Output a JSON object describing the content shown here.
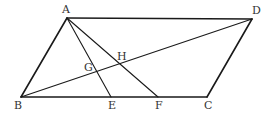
{
  "diagram": {
    "type": "geometry",
    "stroke_color": "#1a1a1a",
    "label_color": "#333333",
    "points": {
      "A": {
        "label": "A",
        "x": 67,
        "y": 18,
        "label_x": 62,
        "label_y": 13
      },
      "B": {
        "label": "B",
        "x": 21,
        "y": 97,
        "label_x": 14,
        "label_y": 109
      },
      "C": {
        "label": "C",
        "x": 207,
        "y": 97,
        "label_x": 204,
        "label_y": 109
      },
      "D": {
        "label": "D",
        "x": 252,
        "y": 19,
        "label_x": 252,
        "label_y": 14
      },
      "E": {
        "label": "E",
        "x": 111,
        "y": 97,
        "label_x": 108,
        "label_y": 109
      },
      "F": {
        "label": "F",
        "x": 158,
        "y": 97,
        "label_x": 155,
        "label_y": 109
      },
      "G": {
        "label": "G",
        "x": 97,
        "y": 71,
        "label_x": 84,
        "label_y": 71
      },
      "H": {
        "label": "H",
        "x": 120,
        "y": 64,
        "label_x": 117,
        "label_y": 60
      }
    },
    "segments": [
      {
        "from": "A",
        "to": "D",
        "name": "side-ad"
      },
      {
        "from": "D",
        "to": "C",
        "name": "side-dc"
      },
      {
        "from": "C",
        "to": "B",
        "name": "side-cb"
      },
      {
        "from": "B",
        "to": "A",
        "name": "side-ba"
      },
      {
        "from": "A",
        "to": "E",
        "name": "segment-ae"
      },
      {
        "from": "A",
        "to": "F",
        "name": "segment-af"
      },
      {
        "from": "B",
        "to": "D",
        "name": "diagonal-bd"
      }
    ]
  }
}
